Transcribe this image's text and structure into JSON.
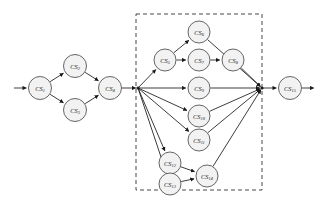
{
  "diagram": {
    "type": "directed-graph",
    "background_color": "#ffffff",
    "node_fill_color": "#f2f2f2",
    "node_stroke_color": "#555555",
    "edge_color": "#1a1a1a",
    "dashed_box_color": "#333333",
    "label_prefix": "CS",
    "nodes": [
      {
        "id": "n1",
        "label": "CS",
        "subscript": "1",
        "label_full": "CS1",
        "cx": 40,
        "cy": 88,
        "r": 11.5,
        "group": "left"
      },
      {
        "id": "n2",
        "label": "CS",
        "subscript": "2",
        "label_full": "CS2",
        "cx": 75,
        "cy": 66,
        "r": 11.5,
        "group": "left"
      },
      {
        "id": "n3",
        "label": "CS",
        "subscript": "3",
        "label_full": "CS3",
        "cx": 75,
        "cy": 110,
        "r": 11.5,
        "group": "left"
      },
      {
        "id": "n4",
        "label": "CS",
        "subscript": "4",
        "label_full": "CS4",
        "cx": 110,
        "cy": 88,
        "r": 11.5,
        "group": "left"
      },
      {
        "id": "n5",
        "label": "CS",
        "subscript": "5",
        "label_full": "CS5",
        "cx": 165,
        "cy": 60,
        "r": 11.0,
        "group": "box"
      },
      {
        "id": "n6",
        "label": "CS",
        "subscript": "6",
        "label_full": "CS6",
        "cx": 199,
        "cy": 32,
        "r": 11.0,
        "group": "box"
      },
      {
        "id": "n7",
        "label": "CS",
        "subscript": "7",
        "label_full": "CS7",
        "cx": 199,
        "cy": 60,
        "r": 11.0,
        "group": "box"
      },
      {
        "id": "n8",
        "label": "CS",
        "subscript": "8",
        "label_full": "CS8",
        "cx": 233,
        "cy": 60,
        "r": 11.0,
        "group": "box"
      },
      {
        "id": "n9",
        "label": "CS",
        "subscript": "9",
        "label_full": "CS9",
        "cx": 199,
        "cy": 88,
        "r": 11.0,
        "group": "box"
      },
      {
        "id": "n10",
        "label": "CS",
        "subscript": "10",
        "label_full": "CS10",
        "cx": 199,
        "cy": 116,
        "r": 11.0,
        "group": "box"
      },
      {
        "id": "n11",
        "label": "CS",
        "subscript": "11",
        "label_full": "CS11",
        "cx": 199,
        "cy": 140,
        "r": 11.0,
        "group": "box"
      },
      {
        "id": "n12",
        "label": "CS",
        "subscript": "12",
        "label_full": "CS12",
        "cx": 170,
        "cy": 163,
        "r": 11.0,
        "group": "box"
      },
      {
        "id": "n13",
        "label": "CS",
        "subscript": "13",
        "label_full": "CS13",
        "cx": 170,
        "cy": 184,
        "r": 11.0,
        "group": "box"
      },
      {
        "id": "n14",
        "label": "CS",
        "subscript": "14",
        "label_full": "CS14",
        "cx": 207,
        "cy": 176,
        "r": 11.0,
        "group": "box"
      },
      {
        "id": "n15",
        "label": "CS",
        "subscript": "15",
        "label_full": "CS15",
        "cx": 290,
        "cy": 88,
        "r": 11.5,
        "group": "right"
      }
    ],
    "junctions": [
      {
        "id": "j-in",
        "cx": 138,
        "cy": 88,
        "label": "split-junction"
      },
      {
        "id": "j-out",
        "cx": 262,
        "cy": 88,
        "label": "merge-junction"
      }
    ],
    "dashed_box": {
      "x": 136,
      "y": 14,
      "width": 126,
      "height": 176,
      "label": "composite-subgraph"
    },
    "entry_arrow": {
      "from_x": 14,
      "to_x": 28,
      "y": 88,
      "label": "workflow-start"
    },
    "exit_arrow": {
      "from_x": 302,
      "to_x": 316,
      "y": 88,
      "label": "workflow-end"
    },
    "edges": [
      {
        "from": "start",
        "to": "n1",
        "label": "start-to-cs1"
      },
      {
        "from": "n1",
        "to": "n2",
        "label": "cs1-to-cs2"
      },
      {
        "from": "n1",
        "to": "n3",
        "label": "cs1-to-cs3"
      },
      {
        "from": "n2",
        "to": "n4",
        "label": "cs2-to-cs4"
      },
      {
        "from": "n3",
        "to": "n4",
        "label": "cs3-to-cs4"
      },
      {
        "from": "n4",
        "to": "j-in",
        "label": "cs4-to-junction"
      },
      {
        "from": "j-in",
        "to": "n5",
        "label": "junction-to-cs5"
      },
      {
        "from": "j-in",
        "to": "n9",
        "label": "junction-to-cs9"
      },
      {
        "from": "j-in",
        "to": "n10",
        "label": "junction-to-cs10"
      },
      {
        "from": "j-in",
        "to": "n11",
        "label": "junction-to-cs11"
      },
      {
        "from": "j-in",
        "to": "n12",
        "label": "junction-to-cs12"
      },
      {
        "from": "j-in",
        "to": "n13",
        "label": "junction-to-cs13"
      },
      {
        "from": "n5",
        "to": "n6",
        "label": "cs5-to-cs6"
      },
      {
        "from": "n5",
        "to": "n7",
        "label": "cs5-to-cs7"
      },
      {
        "from": "n7",
        "to": "n8",
        "label": "cs7-to-cs8"
      },
      {
        "from": "n6",
        "to": "j-out",
        "label": "cs6-to-junction"
      },
      {
        "from": "n8",
        "to": "j-out",
        "label": "cs8-to-junction"
      },
      {
        "from": "n9",
        "to": "j-out",
        "label": "cs9-to-junction"
      },
      {
        "from": "n10",
        "to": "j-out",
        "label": "cs10-to-junction"
      },
      {
        "from": "n11",
        "to": "j-out",
        "label": "cs11-to-junction"
      },
      {
        "from": "n12",
        "to": "n14",
        "label": "cs12-to-cs14"
      },
      {
        "from": "n13",
        "to": "n14",
        "label": "cs13-to-cs14"
      },
      {
        "from": "n14",
        "to": "j-out",
        "label": "cs14-to-junction"
      },
      {
        "from": "j-out",
        "to": "n15",
        "label": "junction-to-cs15"
      },
      {
        "from": "n15",
        "to": "end",
        "label": "cs15-to-end"
      }
    ]
  }
}
